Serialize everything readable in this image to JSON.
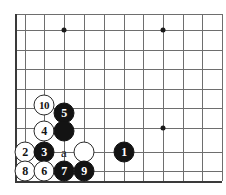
{
  "diagram": {
    "type": "go-board-corner-diagram",
    "board_size": 19,
    "view": "bottom-left corner",
    "geometry": {
      "origin_x": 15,
      "origin_y": 181,
      "spacing": 19.7,
      "cols_visible": 11,
      "rows_visible": 9
    },
    "hoshi_points": [
      {
        "name": "star-point-upper-left",
        "x": 64,
        "y": 30
      },
      {
        "name": "star-point-upper-right",
        "x": 163,
        "y": 30
      },
      {
        "name": "star-point-right",
        "x": 163,
        "y": 128
      }
    ],
    "grid": {
      "vertical_x": [
        15,
        25,
        44,
        64,
        84,
        104,
        124,
        143,
        163,
        183,
        202,
        222
      ],
      "horizontal_y": [
        14,
        30,
        50,
        69,
        89,
        108,
        128,
        152,
        171,
        181
      ]
    },
    "stones": [
      {
        "id": "stone-move-10",
        "color": "white",
        "label": "10",
        "x": 44,
        "y": 105,
        "wide": true
      },
      {
        "id": "stone-move-5",
        "color": "black",
        "label": "5",
        "x": 64,
        "y": 113,
        "wide": false
      },
      {
        "id": "stone-move-4",
        "color": "white",
        "label": "4",
        "x": 44,
        "y": 131,
        "wide": false
      },
      {
        "id": "stone-unnumbered-black-upper",
        "color": "black",
        "label": "",
        "x": 64,
        "y": 131,
        "wide": false
      },
      {
        "id": "stone-move-2",
        "color": "white",
        "label": "2",
        "x": 25,
        "y": 152,
        "wide": false
      },
      {
        "id": "stone-move-3",
        "color": "black",
        "label": "3",
        "x": 44,
        "y": 152,
        "wide": false
      },
      {
        "id": "stone-unnumbered-white-right",
        "color": "white",
        "label": "",
        "x": 84,
        "y": 152,
        "wide": false
      },
      {
        "id": "stone-move-1",
        "color": "black",
        "label": "1",
        "x": 124,
        "y": 152,
        "wide": false
      },
      {
        "id": "stone-move-8",
        "color": "white",
        "label": "8",
        "x": 25,
        "y": 171,
        "wide": false
      },
      {
        "id": "stone-move-6",
        "color": "white",
        "label": "6",
        "x": 44,
        "y": 171,
        "wide": false
      },
      {
        "id": "stone-move-7",
        "color": "black",
        "label": "7",
        "x": 64,
        "y": 171,
        "wide": false
      },
      {
        "id": "stone-move-9",
        "color": "black",
        "label": "9",
        "x": 84,
        "y": 171,
        "wide": false
      }
    ],
    "point_labels": [
      {
        "id": "point-label-a",
        "text": "a",
        "x": 64,
        "y": 152
      }
    ],
    "colors": {
      "background": "#ffffff",
      "grid": "#6e6e6e",
      "edge": "#3a3a3a",
      "black_stone": "#131313",
      "white_stone": "#ffffff",
      "white_stone_border": "#2b2b2b",
      "hoshi": "#1a1a1a"
    }
  }
}
